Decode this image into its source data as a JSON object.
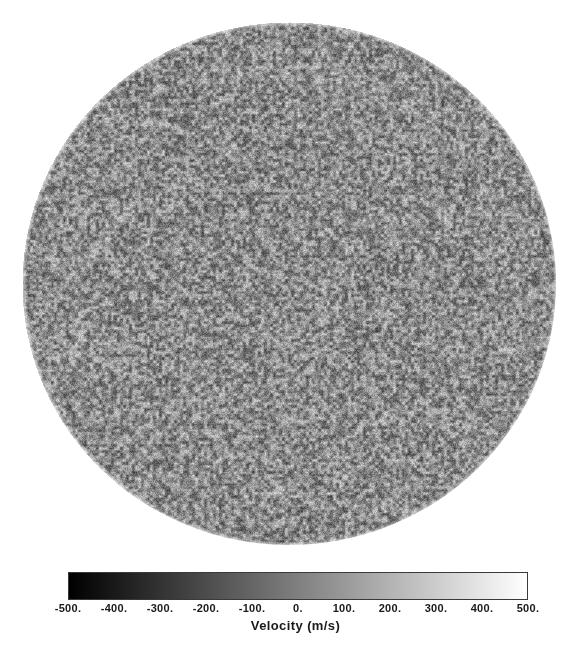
{
  "figure": {
    "background_color": "#ffffff",
    "width": 585,
    "height": 653
  },
  "disk": {
    "name": "solar-disk",
    "description": "Full-disk solar Dopplergram showing line-of-sight velocity as grayscale granulation noise",
    "center_x": 289,
    "center_y": 283,
    "diameter_x": 534,
    "diameter_y": 523,
    "mean_gray": "#8c8c8c",
    "texture": "fine-grained speckle noise"
  },
  "chart_data": {
    "type": "heatmap",
    "title": "",
    "subtitle": "",
    "xlabel": "",
    "ylabel": "",
    "colorbar": {
      "label": "Velocity (m/s)",
      "orientation": "horizontal",
      "cmap": "grayscale",
      "cmap_low_color": "#000000",
      "cmap_high_color": "#ffffff",
      "vmin": -500,
      "vmax": 500,
      "tick_values": [
        -500,
        -400,
        -300,
        -200,
        -100,
        0,
        100,
        200,
        300,
        400,
        500
      ],
      "tick_labels": [
        "-500.",
        "-400.",
        "-300.",
        "-200.",
        "-100.",
        "0.",
        "100.",
        "200.",
        "300.",
        "400.",
        "500."
      ]
    },
    "grid": false,
    "legend": "none",
    "axes_visible": false,
    "data_units": "m/s",
    "data_range": [
      -500,
      500
    ],
    "data_center": 0
  }
}
